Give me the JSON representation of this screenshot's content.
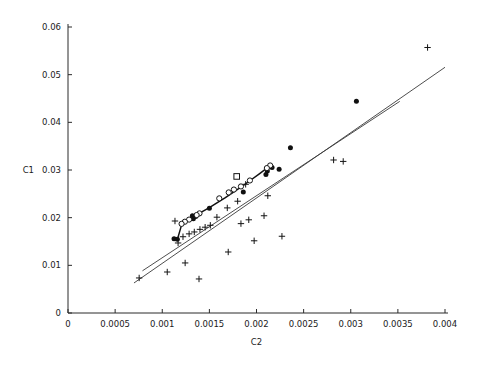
{
  "chart_data": {
    "type": "scatter",
    "title": "",
    "xlabel": "C2",
    "ylabel": "C1",
    "xlim": [
      0,
      0.004
    ],
    "ylim": [
      0,
      0.06
    ],
    "grid": false,
    "legend": "none",
    "xticks": [
      0,
      0.0005,
      0.001,
      0.0015,
      0.002,
      0.0025,
      0.003,
      0.0035,
      0.004
    ],
    "xticklabels": [
      "0",
      "0.0005",
      "0.001",
      "0.0015",
      "0.002",
      "0.0025",
      "0.003",
      "0.0035",
      "0.004"
    ],
    "yticks": [
      0,
      0.01,
      0.02,
      0.03,
      0.04,
      0.05,
      0.06
    ],
    "yticklabels": [
      "0",
      "0.01",
      "0.02",
      "0.03",
      "0.04",
      "0.05",
      "0.06"
    ],
    "series": [
      {
        "name": "plus-markers",
        "marker": "plus",
        "points": [
          [
            0.000755,
            0.00735
          ],
          [
            0.001053,
            0.0086
          ],
          [
            0.00139,
            0.00714
          ],
          [
            0.001243,
            0.0105
          ],
          [
            0.001168,
            0.01469
          ],
          [
            0.0017,
            0.0128
          ],
          [
            0.00122,
            0.016
          ],
          [
            0.001285,
            0.0166
          ],
          [
            0.00134,
            0.017
          ],
          [
            0.0014,
            0.01755
          ],
          [
            0.001455,
            0.018
          ],
          [
            0.00151,
            0.0184
          ],
          [
            0.001975,
            0.01515
          ],
          [
            0.00227,
            0.0161
          ],
          [
            0.001835,
            0.01875
          ],
          [
            0.001918,
            0.01955
          ],
          [
            0.00208,
            0.0204
          ],
          [
            0.00169,
            0.02205
          ],
          [
            0.0018,
            0.02345
          ],
          [
            0.00212,
            0.0246
          ],
          [
            0.001885,
            0.027
          ],
          [
            0.002818,
            0.0321
          ],
          [
            0.00292,
            0.0318
          ],
          [
            0.003815,
            0.0557
          ],
          [
            0.001135,
            0.0193
          ],
          [
            0.00158,
            0.0201
          ]
        ]
      },
      {
        "name": "filled-dots",
        "marker": "dot",
        "points": [
          [
            0.00306,
            0.0444
          ],
          [
            0.00236,
            0.03465
          ],
          [
            0.002165,
            0.0305
          ],
          [
            0.00224,
            0.03015
          ],
          [
            0.0021,
            0.02905
          ],
          [
            0.002115,
            0.0298
          ],
          [
            0.00186,
            0.0254
          ],
          [
            0.001355,
            0.02025
          ],
          [
            0.00132,
            0.0204
          ],
          [
            0.00133,
            0.01975
          ],
          [
            0.001125,
            0.0156
          ],
          [
            0.00116,
            0.01545
          ],
          [
            0.0015,
            0.022
          ]
        ]
      },
      {
        "name": "open-circles",
        "marker": "circle",
        "points": [
          [
            0.002145,
            0.03095
          ],
          [
            0.00211,
            0.0304
          ],
          [
            0.00193,
            0.0278
          ],
          [
            0.001835,
            0.02655
          ],
          [
            0.00176,
            0.0259
          ],
          [
            0.001705,
            0.0253
          ],
          [
            0.001605,
            0.02405
          ],
          [
            0.001395,
            0.0209
          ],
          [
            0.001365,
            0.02055
          ],
          [
            0.001285,
            0.0196
          ],
          [
            0.00124,
            0.01915
          ],
          [
            0.001205,
            0.0187
          ]
        ]
      },
      {
        "name": "square-marker",
        "marker": "square",
        "points": [
          [
            0.00179,
            0.02865
          ]
        ]
      }
    ],
    "lines": [
      {
        "name": "upper-fit-line",
        "style": "solid",
        "points": [
          [
            0.00079,
            0.00885
          ],
          [
            0.00352,
            0.0444
          ]
        ]
      },
      {
        "name": "lower-fit-line",
        "style": "solid",
        "points": [
          [
            0.0007,
            0.0063
          ],
          [
            0.004,
            0.05155
          ]
        ]
      },
      {
        "name": "connected-data-path",
        "style": "solid-heavy",
        "points": [
          [
            0.00111,
            0.01535
          ],
          [
            0.00116,
            0.0154
          ],
          [
            0.00121,
            0.0188
          ],
          [
            0.001255,
            0.01935
          ],
          [
            0.0013,
            0.0198
          ],
          [
            0.001355,
            0.0204
          ],
          [
            0.00142,
            0.0212
          ],
          [
            0.0015,
            0.0221
          ],
          [
            0.00158,
            0.0231
          ],
          [
            0.00167,
            0.0242
          ],
          [
            0.00176,
            0.0254
          ],
          [
            0.00185,
            0.0266
          ],
          [
            0.00194,
            0.0279
          ],
          [
            0.00203,
            0.0292
          ],
          [
            0.00211,
            0.0304
          ],
          [
            0.002165,
            0.03105
          ]
        ]
      }
    ]
  }
}
